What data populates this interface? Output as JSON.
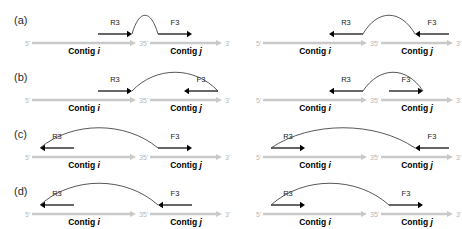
{
  "figure": {
    "colors": {
      "background": "#ffffff",
      "contig_bar": "#c9c9c9",
      "read_arrow": "#000000",
      "arc": "#3a3a3a",
      "end_label": "#b9b9b9",
      "row_label": "#2b2b2b"
    },
    "labels": {
      "five_prime": "5'",
      "three_prime": "3'",
      "contig_i": "Contig i",
      "contig_j": "Contig j",
      "contig_word": "Contig",
      "index_i": "i",
      "index_j": "j",
      "read_r3": "R3",
      "read_f3": "F3"
    },
    "rows": [
      {
        "id": "a",
        "label": "(a)",
        "panels": [
          {
            "id": "a-left",
            "left_read": {
              "name": "R3",
              "direction": "right",
              "anchor": "right-end"
            },
            "right_read": {
              "name": "F3",
              "direction": "right",
              "anchor": "left-end"
            },
            "arc": {
              "from": "left-read-head",
              "to": "right-read-tail",
              "shape": "tall"
            }
          },
          {
            "id": "a-right",
            "left_read": {
              "name": "R3",
              "direction": "left",
              "anchor": "right-end"
            },
            "right_read": {
              "name": "F3",
              "direction": "left",
              "anchor": "right-end"
            },
            "arc": {
              "from": "left-read-tail",
              "to": "right-read-head",
              "shape": "tall"
            }
          }
        ]
      },
      {
        "id": "b",
        "label": "(b)",
        "panels": [
          {
            "id": "b-left",
            "left_read": {
              "name": "R3",
              "direction": "right",
              "anchor": "right-end"
            },
            "right_read": {
              "name": "F3",
              "direction": "left",
              "anchor": "right-end"
            },
            "arc": {
              "from": "left-read-head",
              "to": "right-read-tail",
              "shape": "tall"
            }
          },
          {
            "id": "b-right",
            "left_read": {
              "name": "R3",
              "direction": "left",
              "anchor": "right-end"
            },
            "right_read": {
              "name": "F3",
              "direction": "right",
              "anchor": "left-end"
            },
            "arc": {
              "from": "left-read-tail",
              "to": "right-read-head",
              "shape": "tall"
            }
          }
        ]
      },
      {
        "id": "c",
        "label": "(c)",
        "panels": [
          {
            "id": "c-left",
            "left_read": {
              "name": "R3",
              "direction": "left",
              "anchor": "left-end"
            },
            "right_read": {
              "name": "F3",
              "direction": "right",
              "anchor": "left-end"
            },
            "arc": {
              "from": "left-read-head",
              "to": "right-read-tail",
              "shape": "wide"
            }
          },
          {
            "id": "c-right",
            "left_read": {
              "name": "R3",
              "direction": "right",
              "anchor": "left-end"
            },
            "right_read": {
              "name": "F3",
              "direction": "left",
              "anchor": "right-end"
            },
            "arc": {
              "from": "left-read-tail",
              "to": "right-read-head",
              "shape": "wide"
            }
          }
        ]
      },
      {
        "id": "d",
        "label": "(d)",
        "panels": [
          {
            "id": "d-left",
            "left_read": {
              "name": "R3",
              "direction": "left",
              "anchor": "left-end"
            },
            "right_read": {
              "name": "F3",
              "direction": "left",
              "anchor": "left-end"
            },
            "arc": {
              "from": "left-read-head",
              "to": "right-read-head",
              "shape": "widest"
            }
          },
          {
            "id": "d-right",
            "left_read": {
              "name": "R3",
              "direction": "right",
              "anchor": "left-end"
            },
            "right_read": {
              "name": "F3",
              "direction": "right",
              "anchor": "left-end"
            },
            "arc": {
              "from": "left-read-tail",
              "to": "right-read-tail",
              "shape": "widest"
            }
          }
        ]
      }
    ]
  }
}
